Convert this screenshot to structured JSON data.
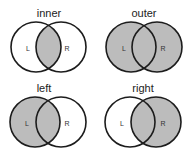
{
  "colors": {
    "fill": "#bcbcbc",
    "stroke": "#1c1c1c",
    "background": "#ffffff"
  },
  "panels": [
    {
      "id": "inner",
      "title": "inner",
      "shaded": "intersection",
      "left_label": "L",
      "right_label": "R",
      "title_pos": [
        49,
        17
      ],
      "left_center": [
        36,
        47
      ],
      "right_center": [
        61,
        47
      ],
      "radius": 25
    },
    {
      "id": "outer",
      "title": "outer",
      "shaded": "union",
      "left_label": "L",
      "right_label": "R",
      "title_pos": [
        144,
        17
      ],
      "left_center": [
        131,
        47
      ],
      "right_center": [
        157,
        47
      ],
      "radius": 25
    },
    {
      "id": "left",
      "title": "left",
      "shaded": "left",
      "left_label": "L",
      "right_label": "R",
      "title_pos": [
        44,
        92
      ],
      "left_center": [
        35,
        122
      ],
      "right_center": [
        61,
        122
      ],
      "radius": 25
    },
    {
      "id": "right",
      "title": "right",
      "shaded": "right",
      "left_label": "L",
      "right_label": "R",
      "title_pos": [
        143,
        92
      ],
      "left_center": [
        130,
        122
      ],
      "right_center": [
        156,
        122
      ],
      "radius": 25
    }
  ]
}
